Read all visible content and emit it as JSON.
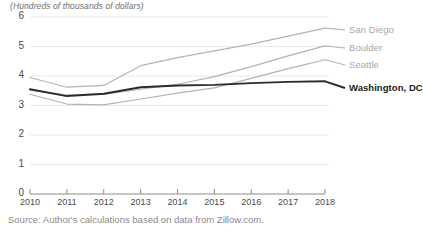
{
  "chart_data": {
    "type": "line",
    "title": "(Hundreds of thousands of dollars)",
    "xlabel": "",
    "ylabel": "(Hundreds of thousands of dollars)",
    "x": [
      2010,
      2011,
      2012,
      2013,
      2014,
      2015,
      2016,
      2017,
      2018
    ],
    "categories": [
      "2010",
      "2011",
      "2012",
      "2013",
      "2014",
      "2015",
      "2016",
      "2017",
      "2018"
    ],
    "xlim": [
      2010,
      2018
    ],
    "ylim": [
      0,
      6
    ],
    "yticks": [
      0,
      1,
      2,
      3,
      4,
      5,
      6
    ],
    "ytick_labels": [
      "0",
      "1",
      "2",
      "3",
      "4",
      "5",
      "6"
    ],
    "grid": true,
    "legend_position": "right-inline-labels",
    "series": [
      {
        "name": "San Diego",
        "color": "#b3b3b3",
        "values": [
          3.95,
          3.62,
          3.68,
          4.35,
          4.62,
          4.85,
          5.08,
          5.35,
          5.62
        ]
      },
      {
        "name": "Boulder",
        "color": "#b3b3b3",
        "values": [
          3.52,
          3.35,
          3.38,
          3.55,
          3.72,
          3.98,
          4.32,
          4.68,
          5.02
        ]
      },
      {
        "name": "Seattle",
        "color": "#b3b3b3",
        "values": [
          3.38,
          3.05,
          3.02,
          3.22,
          3.42,
          3.6,
          3.92,
          4.25,
          4.55
        ]
      },
      {
        "name": "Washington, DC",
        "color": "#2b2b2b",
        "values": [
          3.55,
          3.32,
          3.4,
          3.62,
          3.68,
          3.7,
          3.76,
          3.8,
          3.82
        ],
        "emphasis": true
      }
    ]
  },
  "labels": {
    "san_diego": "San Diego",
    "boulder": "Boulder",
    "seattle": "Seattle",
    "washington_dc": "Washington, DC"
  },
  "footer": {
    "source": "Source: Author's calculations based on data from Zillow.com."
  },
  "colors": {
    "grid": "#eaeaea",
    "axis": "#8c8c8c",
    "muted_line": "#b3b3b3",
    "emphasis_line": "#2b2b2b",
    "tick_text": "#4a4a4a",
    "title_text": "#6d6d6d",
    "source_text": "#8a8a8a"
  }
}
